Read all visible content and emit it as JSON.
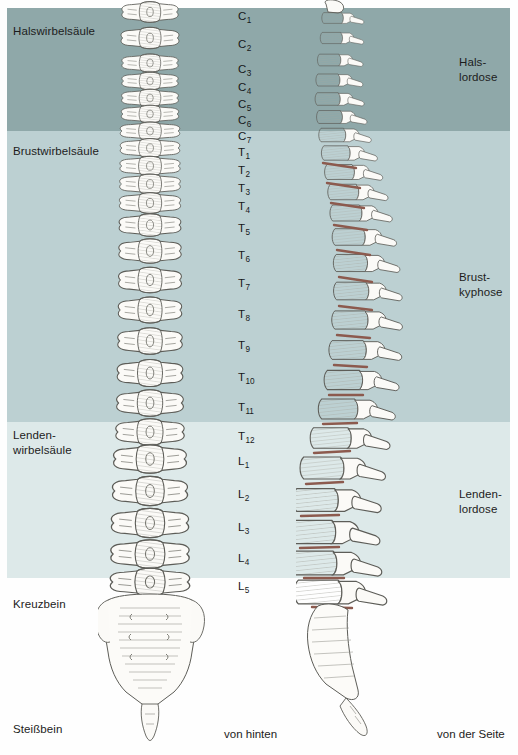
{
  "diagram": {
    "title": "Wirbelsäule",
    "language": "de"
  },
  "regions": {
    "left_labels": [
      {
        "name": "cervical-spine",
        "text": "Halswirbelsäule"
      },
      {
        "name": "thoracic-spine",
        "text": "Brustwirbelsäule"
      },
      {
        "name": "lumbar-spine",
        "text": "Lenden-\nwirbelsäule"
      },
      {
        "name": "sacrum",
        "text": "Kreuzbein"
      },
      {
        "name": "coccyx",
        "text": "Steißbein"
      }
    ],
    "right_labels": [
      {
        "name": "cervical-lordosis",
        "text": "Hals-\nlordose"
      },
      {
        "name": "thoracic-kyphosis",
        "text": "Brust-\nkyphose"
      },
      {
        "name": "lumbar-lordosis",
        "text": "Lenden-\nlordose"
      }
    ],
    "band_colors": {
      "cervical": "#8fa8a9",
      "thoracic": "#bcd0d2",
      "lumbar": "#dde9e9"
    }
  },
  "vertebrae": [
    {
      "letter": "C",
      "number": "1",
      "y": 10
    },
    {
      "letter": "C",
      "number": "2",
      "y": 38
    },
    {
      "letter": "C",
      "number": "3",
      "y": 63
    },
    {
      "letter": "C",
      "number": "4",
      "y": 81
    },
    {
      "letter": "C",
      "number": "5",
      "y": 98
    },
    {
      "letter": "C",
      "number": "6",
      "y": 114
    },
    {
      "letter": "C",
      "number": "7",
      "y": 130
    },
    {
      "letter": "T",
      "number": "1",
      "y": 146
    },
    {
      "letter": "T",
      "number": "2",
      "y": 164
    },
    {
      "letter": "T",
      "number": "3",
      "y": 182
    },
    {
      "letter": "T",
      "number": "4",
      "y": 200
    },
    {
      "letter": "T",
      "number": "5",
      "y": 222
    },
    {
      "letter": "T",
      "number": "6",
      "y": 249
    },
    {
      "letter": "T",
      "number": "7",
      "y": 277
    },
    {
      "letter": "T",
      "number": "8",
      "y": 308
    },
    {
      "letter": "T",
      "number": "9",
      "y": 339
    },
    {
      "letter": "T",
      "number": "10",
      "y": 371
    },
    {
      "letter": "T",
      "number": "11",
      "y": 401
    },
    {
      "letter": "T",
      "number": "12",
      "y": 430
    },
    {
      "letter": "L",
      "number": "1",
      "y": 455
    },
    {
      "letter": "L",
      "number": "2",
      "y": 488
    },
    {
      "letter": "L",
      "number": "3",
      "y": 521
    },
    {
      "letter": "L",
      "number": "4",
      "y": 552
    },
    {
      "letter": "L",
      "number": "5",
      "y": 580
    }
  ],
  "captions": {
    "posterior": "von hinten",
    "lateral": "von der Seite"
  },
  "illustration": {
    "bone_fill": "#fbfaf7",
    "bone_outline": "#5c5c58",
    "disc_color": "#8c5a4e",
    "hatch_color": "#9a9a94"
  }
}
